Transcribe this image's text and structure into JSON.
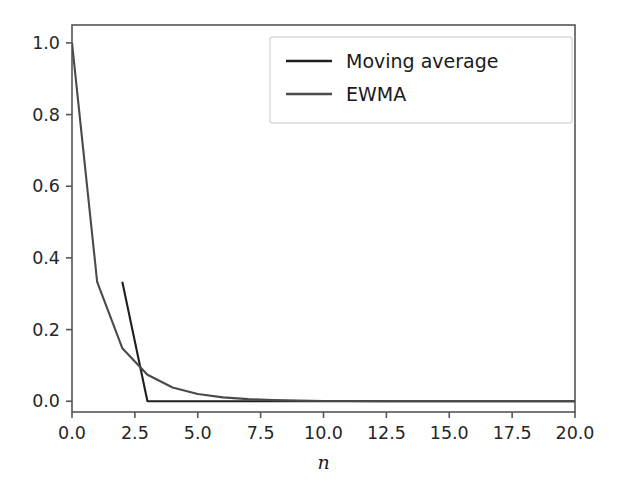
{
  "chart_data": {
    "type": "line",
    "title": "",
    "subtitle": "",
    "xlabel": "n",
    "ylabel": "",
    "xlim": [
      0.0,
      20.0
    ],
    "ylim": [
      -0.03,
      1.05
    ],
    "grid": false,
    "legend_position": "upper right",
    "xticks": [
      0.0,
      2.5,
      5.0,
      7.5,
      10.0,
      12.5,
      15.0,
      17.5,
      20.0
    ],
    "xtick_labels": [
      "0.0",
      "2.5",
      "5.0",
      "7.5",
      "10.0",
      "12.5",
      "15.0",
      "17.5",
      "20.0"
    ],
    "yticks": [
      0.0,
      0.2,
      0.4,
      0.6,
      0.8,
      1.0
    ],
    "ytick_labels": [
      "0.0",
      "0.2",
      "0.4",
      "0.6",
      "0.8",
      "1.0"
    ],
    "series": [
      {
        "name": "Moving average",
        "color": "#1f1f1f",
        "x": [
          2,
          3,
          4,
          5,
          6,
          7,
          8,
          9,
          10,
          11,
          12,
          13,
          14,
          15,
          16,
          17,
          18,
          19,
          20
        ],
        "values": [
          0.3333,
          0.0,
          0.0,
          0.0,
          0.0,
          0.0,
          0.0,
          0.0,
          0.0,
          0.0,
          0.0,
          0.0,
          0.0,
          0.0,
          0.0,
          0.0,
          0.0,
          0.0,
          0.0
        ]
      },
      {
        "name": "EWMA",
        "color": "#4a4a4a",
        "x": [
          0,
          1,
          2,
          3,
          4,
          5,
          6,
          7,
          8,
          9,
          10,
          11,
          12,
          13,
          14,
          15,
          16,
          17,
          18,
          19,
          20
        ],
        "values": [
          1.0,
          0.3333,
          0.1481,
          0.0741,
          0.0384,
          0.0203,
          0.0108,
          0.0058,
          0.0031,
          0.0017,
          0.0009,
          0.0005,
          0.0003,
          0.00015,
          8e-05,
          4e-05,
          2e-05,
          1e-05,
          6e-06,
          3e-06,
          0.0
        ]
      }
    ]
  },
  "legend": {
    "entries": [
      {
        "label": "Moving average"
      },
      {
        "label": "EWMA"
      }
    ]
  },
  "axes": {
    "xlabel": "n"
  }
}
